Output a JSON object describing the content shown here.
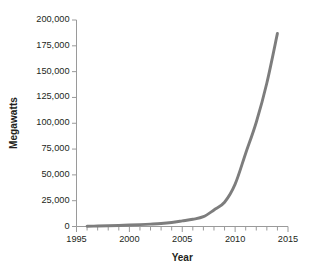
{
  "chart_data": {
    "type": "line",
    "title": "",
    "xlabel": "Year",
    "ylabel": "Megawatts",
    "xlim": [
      1995,
      2015
    ],
    "ylim": [
      0,
      200000
    ],
    "grid": false,
    "legend": null,
    "line_color": "#7d7d7d",
    "axis_color": "#9a9a9a",
    "x_major_ticks": [
      1995,
      2000,
      2005,
      2010,
      2015
    ],
    "x_major_tick_labels": [
      "1995",
      "2000",
      "2005",
      "2010",
      "2015"
    ],
    "x_minor_tick_interval": 1,
    "y_ticks": [
      0,
      25000,
      50000,
      75000,
      100000,
      125000,
      150000,
      175000,
      200000
    ],
    "y_tick_labels": [
      "0",
      "25,000",
      "50,000",
      "75,000",
      "100,000",
      "125,000",
      "150,000",
      "175,000",
      "200,000"
    ],
    "series": [
      {
        "name": "Installed capacity",
        "x": [
          1996,
          1997,
          1998,
          1999,
          2000,
          2001,
          2002,
          2003,
          2004,
          2005,
          2006,
          2007,
          2008,
          2009,
          2010,
          2011,
          2012,
          2013,
          2014
        ],
        "values": [
          300,
          450,
          700,
          1000,
          1400,
          1800,
          2300,
          2900,
          3900,
          5400,
          7000,
          9500,
          16000,
          23500,
          41000,
          71000,
          101000,
          139000,
          187000
        ]
      }
    ]
  }
}
